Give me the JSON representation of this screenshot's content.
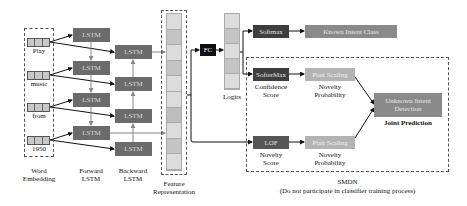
{
  "embedding": {
    "label_line1": "Word",
    "label_line2": "Embedding",
    "words": [
      "Play",
      "music",
      "from",
      "1950"
    ]
  },
  "forward_lstm": {
    "label_line1": "Forward",
    "label_line2": "LSTM",
    "cells": [
      "LSTM",
      "LSTM",
      "LSTM",
      "LSTM"
    ]
  },
  "backward_lstm": {
    "label_line1": "Backward",
    "label_line2": "LSTM",
    "cells": [
      "LSTM",
      "LSTM",
      "LSTM",
      "LSTM"
    ]
  },
  "feature": {
    "label_line1": "Feature",
    "label_line2": "Representation",
    "cell_colors": [
      "#dcdcdc",
      "#c4c4c4",
      "#dcdcdc",
      "#c4c4c4",
      "#dcdcdc",
      "#dcdcdc",
      "#bdbdbd",
      "#dcdcdc",
      "#c4c4c4",
      "#dcdcdc"
    ]
  },
  "fc": {
    "label": "FC"
  },
  "logits": {
    "label": "Logits",
    "cell_colors": [
      "#dcdcdc",
      "#c4c4c4",
      "#dcdcdc",
      "#c4c4c4",
      "#dcdcdc"
    ]
  },
  "softmax": {
    "label": "Softmax"
  },
  "known_intent": {
    "label": "Known Intent Class"
  },
  "smdn": {
    "title": "SMDN",
    "subtitle": "(Do not participate  in classifier  training  process)",
    "softermax": {
      "label": "SofterMax",
      "caption_line1": "Confidence",
      "caption_line2": "Score"
    },
    "platt_top": {
      "label": "Platt Scaling",
      "caption_line1": "Novelty",
      "caption_line2": "Probability"
    },
    "lof": {
      "label": "LOF",
      "caption_line1": "Novelty",
      "caption_line2": "Score"
    },
    "platt_bottom": {
      "label": "Platt Scaling",
      "caption_line1": "Novelty",
      "caption_line2": "Probability"
    },
    "unknown": {
      "label_line1": "Unknown Intent",
      "label_line2": "Detection",
      "caption": "Joint Prediction"
    }
  }
}
